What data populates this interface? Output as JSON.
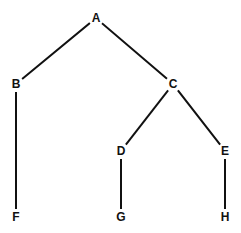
{
  "diagram": {
    "type": "tree",
    "nodes": [
      {
        "id": "A",
        "label": "A"
      },
      {
        "id": "B",
        "label": "B"
      },
      {
        "id": "C",
        "label": "C"
      },
      {
        "id": "D",
        "label": "D"
      },
      {
        "id": "E",
        "label": "E"
      },
      {
        "id": "F",
        "label": "F"
      },
      {
        "id": "G",
        "label": "G"
      },
      {
        "id": "H",
        "label": "H"
      }
    ],
    "edges": [
      {
        "from": "A",
        "to": "B"
      },
      {
        "from": "A",
        "to": "C"
      },
      {
        "from": "B",
        "to": "F"
      },
      {
        "from": "C",
        "to": "D"
      },
      {
        "from": "C",
        "to": "E"
      },
      {
        "from": "D",
        "to": "G"
      },
      {
        "from": "E",
        "to": "H"
      }
    ],
    "colors": {
      "line": "#111111",
      "text": "#111111",
      "background": "#ffffff"
    }
  }
}
